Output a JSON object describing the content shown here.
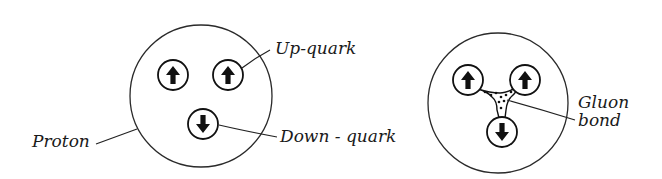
{
  "diagram": {
    "colors": {
      "ink": "#111111",
      "background": "#ffffff"
    },
    "left_figure": {
      "name": "proton",
      "outline": {
        "cx": 201,
        "cy": 96,
        "r": 71
      },
      "quarks": [
        {
          "type": "up",
          "arrow": "up",
          "cx": 173,
          "cy": 75
        },
        {
          "type": "up",
          "arrow": "up",
          "cx": 228,
          "cy": 75
        },
        {
          "type": "down",
          "arrow": "down",
          "cx": 203,
          "cy": 124
        }
      ],
      "labels": {
        "proton": "Proton",
        "up_quark": "Up-quark",
        "down_quark": "Down - quark"
      }
    },
    "right_figure": {
      "name": "proton-with-gluon-bond",
      "outline": {
        "cx": 498,
        "cy": 103,
        "r": 70
      },
      "quarks": [
        {
          "type": "up",
          "arrow": "up",
          "cx": 468,
          "cy": 80
        },
        {
          "type": "up",
          "arrow": "up",
          "cx": 525,
          "cy": 80
        },
        {
          "type": "down",
          "arrow": "down",
          "cx": 502,
          "cy": 132
        }
      ],
      "labels": {
        "gluon_line1": "Gluon",
        "gluon_line2": "bond"
      }
    }
  }
}
